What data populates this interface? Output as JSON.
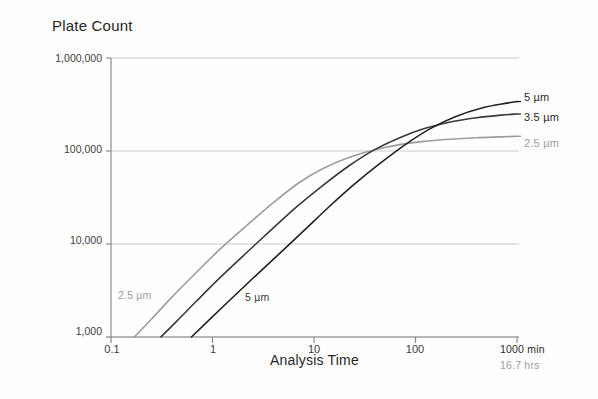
{
  "figure": {
    "width": 598,
    "height": 399,
    "background": "#fefefe"
  },
  "chart_data": {
    "type": "line",
    "title": "Plate Count",
    "xlabel": "Analysis Time",
    "ylabel": "Plate Count",
    "xscale": "log",
    "yscale": "log",
    "xlim": [
      0.1,
      1000
    ],
    "ylim": [
      1000,
      1000000
    ],
    "grid": true,
    "gridlines_y": [
      1000,
      10000,
      100000,
      1000000
    ],
    "legend_position": "right-outside",
    "xticks": [
      0.1,
      1,
      10,
      100,
      1000
    ],
    "xticklabels": [
      "0.1",
      "1",
      "10",
      "100",
      "1000 min"
    ],
    "xtick_secondary_label": "16.7 hrs",
    "yticks": [
      1000,
      10000,
      100000,
      1000000
    ],
    "yticklabels": [
      "1,000",
      "10,000",
      "100,000",
      "1,000,000"
    ],
    "series": [
      {
        "name": "2.5 µm",
        "color": "#9d9d9d",
        "x": [
          0.17,
          0.25,
          0.4,
          0.7,
          1.2,
          2.2,
          4.0,
          7.0,
          12.0,
          22.0,
          40.0,
          70.0,
          120.0,
          220.0,
          400.0,
          700.0,
          1000.0
        ],
        "y": [
          1000,
          1550,
          2700,
          5000,
          8900,
          16000,
          28000,
          45000,
          64000,
          85000,
          103000,
          117000,
          127000,
          134000,
          139000,
          142000,
          144000
        ]
      },
      {
        "name": "3.5 µm",
        "color": "#3a3a3a",
        "x": [
          0.31,
          0.45,
          0.7,
          1.2,
          2.2,
          4.0,
          7.0,
          12.0,
          22.0,
          40.0,
          70.0,
          120.0,
          220.0,
          400.0,
          700.0,
          1000.0
        ],
        "y": [
          1000,
          1500,
          2450,
          4400,
          8200,
          15000,
          26000,
          42000,
          69000,
          104000,
          139000,
          173000,
          205000,
          228000,
          243000,
          250000
        ]
      },
      {
        "name": "5 µm",
        "color": "#222222",
        "x": [
          0.62,
          0.9,
          1.4,
          2.4,
          4.4,
          8.0,
          14.0,
          25.0,
          45.0,
          80.0,
          140.0,
          250.0,
          450.0,
          800.0,
          1000.0
        ],
        "y": [
          1000,
          1480,
          2350,
          4100,
          7600,
          14000,
          25000,
          44000,
          74000,
          118000,
          174000,
          235000,
          290000,
          327000,
          340000
        ]
      }
    ],
    "annotations": [
      {
        "text": "2.5 µm",
        "x": 0.16,
        "y": 2700,
        "color": "#9d9d9d",
        "placement": "in-plot-left"
      },
      {
        "text": "5 µm",
        "x": 2.6,
        "y": 2550,
        "color": "#3a3a3a",
        "placement": "in-plot-left"
      },
      {
        "text": "5 µm",
        "x": 1000,
        "y": 340000,
        "color": "#2b2b2b",
        "placement": "right-legend"
      },
      {
        "text": "3.5 µm",
        "x": 1000,
        "y": 250000,
        "color": "#2b2b2b",
        "placement": "right-legend"
      },
      {
        "text": "2.5 µm",
        "x": 1000,
        "y": 144000,
        "color": "#9d9d9d",
        "placement": "right-legend"
      }
    ]
  },
  "axes": {
    "y_labels": [
      "1,000,000",
      "100,000",
      "10,000",
      "1,000"
    ],
    "x_labels": [
      "0.1",
      "1",
      "10",
      "100",
      "1000 min"
    ],
    "x_secondary": "16.7 hrs"
  },
  "legend": {
    "entries": [
      {
        "label": "5 µm",
        "color": "#2b2b2b"
      },
      {
        "label": "3.5 µm",
        "color": "#2b2b2b"
      },
      {
        "label": "2.5 µm",
        "color": "#9d9d9d"
      }
    ]
  },
  "inline_labels": {
    "left_gray": "2.5 µm",
    "left_dark": "5 µm"
  },
  "colors": {
    "grid": "#c9c9c9",
    "axis": "#8a8a8a",
    "series_2_5": "#9d9d9d",
    "series_3_5": "#3a3a3a",
    "series_5": "#222222",
    "text": "#2b2b2b",
    "text_gray": "#9d9d9d"
  }
}
